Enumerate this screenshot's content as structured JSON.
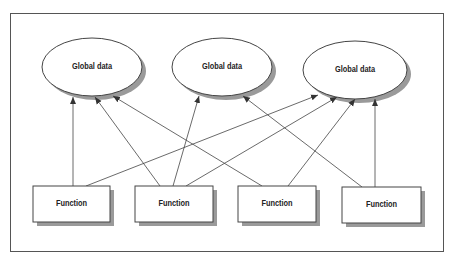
{
  "diagram": {
    "type": "dependency-diagram",
    "colors": {
      "stroke": "#444444",
      "shadow": "#9a9a9a",
      "fill": "#ffffff",
      "frame": "#555555"
    },
    "global_data": [
      {
        "id": "g1",
        "label": "Global data",
        "cx": 92,
        "cy": 67,
        "rx": 50,
        "ry": 29
      },
      {
        "id": "g2",
        "label": "Global data",
        "cx": 222,
        "cy": 67,
        "rx": 50,
        "ry": 29
      },
      {
        "id": "g3",
        "label": "Global data",
        "cx": 355,
        "cy": 70,
        "rx": 52,
        "ry": 29
      }
    ],
    "functions": [
      {
        "id": "f1",
        "label": "Function",
        "x": 33,
        "y": 186,
        "w": 77,
        "h": 36
      },
      {
        "id": "f2",
        "label": "Function",
        "x": 135,
        "y": 186,
        "w": 78,
        "h": 36
      },
      {
        "id": "f3",
        "label": "Function",
        "x": 238,
        "y": 186,
        "w": 78,
        "h": 36
      },
      {
        "id": "f4",
        "label": "Function",
        "x": 342,
        "y": 187,
        "w": 79,
        "h": 36
      }
    ],
    "edges": [
      {
        "from": "f1",
        "to": "g1",
        "x1": 73,
        "y1": 186,
        "x2": 73,
        "y2": 97
      },
      {
        "from": "f1",
        "to": "g3",
        "x1": 86,
        "y1": 186,
        "x2": 318,
        "y2": 95
      },
      {
        "from": "f2",
        "to": "g1",
        "x1": 160,
        "y1": 186,
        "x2": 95,
        "y2": 97
      },
      {
        "from": "f2",
        "to": "g2",
        "x1": 173,
        "y1": 186,
        "x2": 199,
        "y2": 96
      },
      {
        "from": "f2",
        "to": "g3",
        "x1": 186,
        "y1": 186,
        "x2": 337,
        "y2": 97
      },
      {
        "from": "f3",
        "to": "g1",
        "x1": 262,
        "y1": 186,
        "x2": 113,
        "y2": 96
      },
      {
        "from": "f3",
        "to": "g3",
        "x1": 288,
        "y1": 186,
        "x2": 355,
        "y2": 99
      },
      {
        "from": "f4",
        "to": "g2",
        "x1": 362,
        "y1": 187,
        "x2": 243,
        "y2": 96
      },
      {
        "from": "f4",
        "to": "g3",
        "x1": 375,
        "y1": 187,
        "x2": 375,
        "y2": 99
      }
    ]
  }
}
